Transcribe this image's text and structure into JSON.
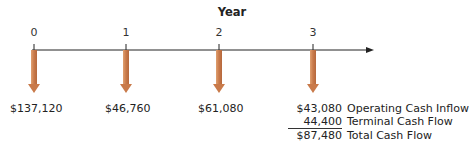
{
  "timeline": {
    "title": "Year",
    "ticks": [
      "0",
      "1",
      "2",
      "3"
    ],
    "arrow_color": "#c97a4a",
    "axis_color": "#222222"
  },
  "cash_flows": [
    {
      "year": "0",
      "value": "$137,120"
    },
    {
      "year": "1",
      "value": "$46,760"
    },
    {
      "year": "2",
      "value": "$61,080"
    }
  ],
  "year3_breakdown": {
    "operating": {
      "amount": "$43,080",
      "label": "Operating Cash Inflow"
    },
    "terminal": {
      "amount": "44,400",
      "label": "Terminal Cash Flow"
    },
    "total": {
      "amount": "$87,480",
      "label": "Total Cash Flow"
    }
  }
}
